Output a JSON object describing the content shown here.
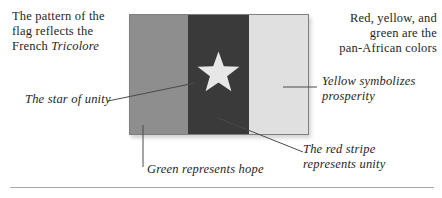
{
  "figure": {
    "captions": {
      "top_left": {
        "line1": "The pattern of the",
        "line2": "flag reflects the",
        "line3_regular": "French ",
        "line3_italic": "Tricolore"
      },
      "top_right": {
        "line1": "Red, yellow, and",
        "line2": "green are the",
        "line3": "pan-African colors"
      }
    },
    "labels": {
      "star": "The star of unity",
      "yellow_line1": "Yellow symbolizes",
      "yellow_line2": "prosperity",
      "green": "Green represents hope",
      "red_line1": "The red stripe",
      "red_line2": "represents unity"
    },
    "flag": {
      "stripe_order": [
        "green",
        "red",
        "yellow"
      ],
      "star": "five-pointed star, centered on red stripe"
    }
  },
  "colors": {
    "background": "#ffffff",
    "text": "#262626",
    "stripe_green": "#8e8e8e",
    "stripe_red": "#3a3a3a",
    "stripe_yellow": "#e0e0e0",
    "star": "#e7e7e7",
    "flag_border": "#7f7f7f",
    "leader_line": "#4a4a4a",
    "divider": "#a8a8a8"
  }
}
